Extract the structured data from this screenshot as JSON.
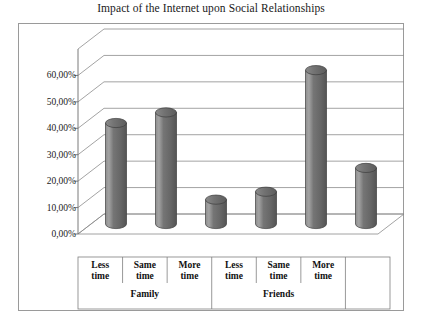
{
  "chart_data": {
    "type": "bar",
    "title": "Impact of the Internet upon Social Relationships",
    "xlabel": "",
    "ylabel": "",
    "ylim": [
      0,
      70
    ],
    "grid": true,
    "legend": false,
    "style": "3d-cylinder",
    "decimal_separator": ",",
    "categories": [
      "Less time",
      "Same time",
      "More time",
      "Less time",
      "Same time",
      "More time"
    ],
    "category_lines": [
      [
        "Less",
        "time"
      ],
      [
        "Same",
        "time"
      ],
      [
        "More",
        "time"
      ],
      [
        "Less",
        "time"
      ],
      [
        "Same",
        "time"
      ],
      [
        "More",
        "time"
      ]
    ],
    "groups": [
      {
        "label": "Family",
        "categories": [
          "Less time",
          "Same time",
          "More time"
        ]
      },
      {
        "label": "Friends",
        "categories": [
          "Less time",
          "Same time",
          "More time"
        ]
      }
    ],
    "values": [
      42,
      46,
      13,
      16,
      62,
      25
    ],
    "value_labels": [
      "42,00%",
      "46,00%",
      "13,00%",
      "16,00%",
      "62,00%",
      "25,00%"
    ],
    "ytick_values": [
      0,
      10,
      20,
      30,
      40,
      50,
      60
    ],
    "ytick_labels": [
      "0,00%",
      "10,00%",
      "20,00%",
      "30,00%",
      "40,00%",
      "50,00%",
      "60,00%"
    ],
    "colors": {
      "bar_fill": "#6e6e6e",
      "bar_highlight": "#9d9d9d",
      "bar_shadow": "#4f4f4f",
      "bar_outline": "#3d3d3d",
      "gridline": "#8c8c8c",
      "axis": "#6b6b6b",
      "frame": "#9a9a9a",
      "text": "#1a1a1a",
      "background": "#ffffff"
    }
  }
}
